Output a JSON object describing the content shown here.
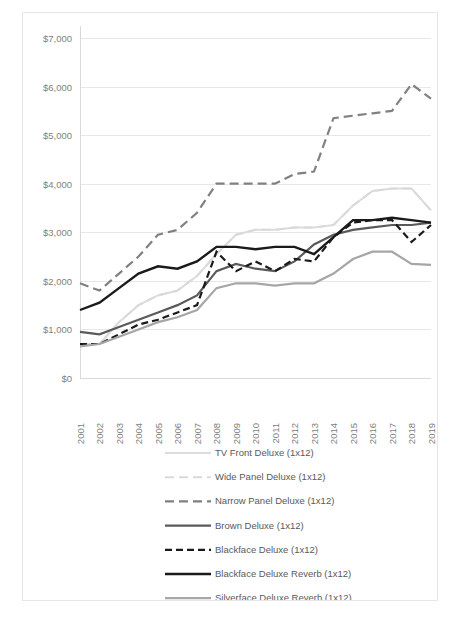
{
  "chart_data": {
    "type": "line",
    "title": "",
    "subtitle": "",
    "xlabel": "",
    "ylabel": "",
    "grid": true,
    "legend_position": "bottom",
    "x": [
      2001,
      2002,
      2003,
      2004,
      2005,
      2006,
      2007,
      2008,
      2009,
      2010,
      2011,
      2012,
      2013,
      2014,
      2015,
      2016,
      2017,
      2018,
      2019
    ],
    "x_tick_labels": [
      "2001",
      "2002",
      "2003",
      "2004",
      "2005",
      "2006",
      "2007",
      "2008",
      "2009",
      "2010",
      "2011",
      "2012",
      "2013",
      "2014",
      "2015",
      "2016",
      "2017",
      "2018",
      "2019"
    ],
    "y_tick_labels": [
      "$7,000",
      "$6,000",
      "$5,000",
      "$4,000",
      "$3,000",
      "$2,000",
      "$1,000",
      "$0"
    ],
    "y_tick_values": [
      7000,
      6000,
      5000,
      4000,
      3000,
      2000,
      1000,
      0
    ],
    "ylim": [
      0,
      7000
    ],
    "series": [
      {
        "name": "TV Front Deluxe (1x12)",
        "color": "#dcdcdc",
        "width": 2.0,
        "dash": "none",
        "values": [
          700,
          700,
          1150,
          1500,
          1700,
          1800,
          2100,
          2550,
          2950,
          3050,
          3050,
          3100,
          3100,
          3150,
          3550,
          3850,
          3900,
          3900,
          3450
        ]
      },
      {
        "name": "Wide Panel Deluxe (1x12)",
        "color": "#d9d9d9",
        "width": 2.0,
        "dash": "9 5",
        "values": [
          700,
          700,
          1150,
          1500,
          1700,
          1800,
          2100,
          2550,
          2950,
          3050,
          3050,
          3100,
          3100,
          3150,
          3550,
          3850,
          3900,
          3900,
          3450
        ]
      },
      {
        "name": "Narrow Panel Deluxe (1x12)",
        "color": "#808080",
        "width": 2.2,
        "dash": "9 5",
        "values": [
          1950,
          1800,
          2150,
          2500,
          2950,
          3050,
          3400,
          4000,
          4000,
          4000,
          4000,
          4200,
          4250,
          5350,
          5400,
          5450,
          5500,
          6050,
          5750
        ]
      },
      {
        "name": "Brown Deluxe (1x12)",
        "color": "#5a5a5a",
        "width": 2.2,
        "dash": "none",
        "values": [
          950,
          900,
          1050,
          1200,
          1350,
          1500,
          1700,
          2200,
          2350,
          2250,
          2200,
          2400,
          2750,
          2950,
          3050,
          3100,
          3150,
          3150,
          3200
        ]
      },
      {
        "name": "Blackface Deluxe (1x12)",
        "color": "#1a1a1a",
        "width": 2.2,
        "dash": "7 4",
        "values": [
          700,
          700,
          900,
          1100,
          1200,
          1350,
          1500,
          2600,
          2200,
          2400,
          2200,
          2450,
          2400,
          2900,
          3200,
          3250,
          3250,
          2800,
          3150
        ]
      },
      {
        "name": "Blackface Deluxe Reverb (1x12)",
        "color": "#1a1a1a",
        "width": 2.4,
        "dash": "none",
        "values": [
          1400,
          1550,
          1850,
          2150,
          2300,
          2250,
          2400,
          2700,
          2700,
          2650,
          2700,
          2700,
          2550,
          2900,
          3250,
          3250,
          3300,
          3250,
          3200
        ]
      },
      {
        "name": "Silverface Deluxe Reverb (1x12)",
        "color": "#a6a6a6",
        "width": 2.2,
        "dash": "none",
        "values": [
          650,
          700,
          850,
          1000,
          1150,
          1250,
          1400,
          1850,
          1950,
          1950,
          1900,
          1950,
          1950,
          2150,
          2450,
          2600,
          2600,
          2350,
          2330
        ]
      }
    ]
  },
  "legend": {
    "items": [
      {
        "label": "TV Front Deluxe (1x12)"
      },
      {
        "label": "Wide Panel Deluxe (1x12)"
      },
      {
        "label": "Narrow Panel Deluxe (1x12)"
      },
      {
        "label": "Brown Deluxe (1x12)"
      },
      {
        "label": "Blackface Deluxe (1x12)"
      },
      {
        "label": "Blackface Deluxe Reverb (1x12)"
      },
      {
        "label": "Silverface Deluxe Reverb (1x12)"
      }
    ]
  }
}
